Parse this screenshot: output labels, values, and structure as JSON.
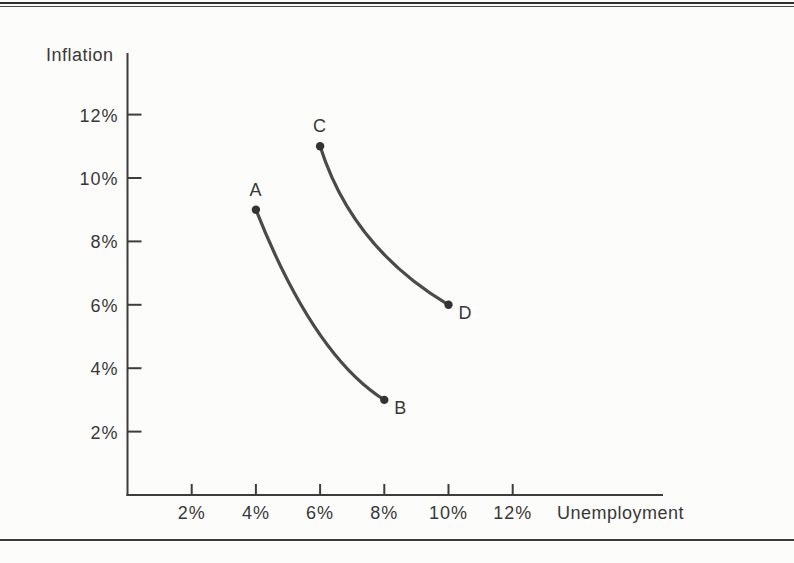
{
  "colors": {
    "paper": "#fcfcfa",
    "ink": "#383838",
    "axis": "#3d3d3d",
    "curve": "#4a4a4a",
    "dot": "#333333",
    "rule": "#2f2f2f"
  },
  "chart_data": {
    "type": "line",
    "title": "",
    "xlabel": "Unemployment",
    "ylabel": "Inflation",
    "xlim": [
      0,
      14
    ],
    "ylim": [
      0,
      14
    ],
    "grid": false,
    "legend": "none",
    "x_ticks": [
      {
        "value": 2,
        "label": "2%"
      },
      {
        "value": 4,
        "label": "4%"
      },
      {
        "value": 6,
        "label": "6%"
      },
      {
        "value": 8,
        "label": "8%"
      },
      {
        "value": 10,
        "label": "10%"
      },
      {
        "value": 12,
        "label": "12%"
      }
    ],
    "y_ticks": [
      {
        "value": 2,
        "label": "2%"
      },
      {
        "value": 4,
        "label": "4%"
      },
      {
        "value": 6,
        "label": "6%"
      },
      {
        "value": 8,
        "label": "8%"
      },
      {
        "value": 10,
        "label": "10%"
      },
      {
        "value": 12,
        "label": "12%"
      }
    ],
    "series": [
      {
        "name": "phillips-curve-1",
        "color": "#4a4a4a",
        "points": [
          {
            "label": "A",
            "x": 4,
            "y": 9,
            "label_position": "above"
          },
          {
            "label": "B",
            "x": 8,
            "y": 3,
            "label_position": "right"
          }
        ],
        "control": {
          "x": 5.8,
          "y": 4.4
        }
      },
      {
        "name": "phillips-curve-2",
        "color": "#4a4a4a",
        "points": [
          {
            "label": "C",
            "x": 6,
            "y": 11,
            "label_position": "above"
          },
          {
            "label": "D",
            "x": 10,
            "y": 6,
            "label_position": "right"
          }
        ],
        "control": {
          "x": 7.0,
          "y": 7.8
        }
      }
    ]
  }
}
